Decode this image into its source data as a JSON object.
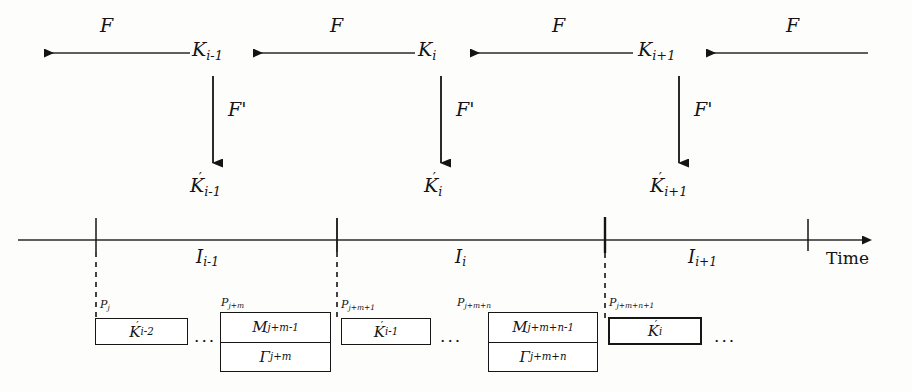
{
  "figure": {
    "type": "timeline-state-diagram",
    "background_color": "#fdfdfc",
    "ink_color": "#141414"
  },
  "chain": {
    "edge_label": "F",
    "edge_labels": [
      "F",
      "F",
      "F",
      "F"
    ],
    "nodes": [
      {
        "name": "K",
        "sub": "i-1",
        "text": "K"
      },
      {
        "name": "K",
        "sub": "i",
        "text": "K"
      },
      {
        "name": "K",
        "sub": "i+1",
        "text": "K"
      }
    ],
    "node_texts": [
      "K",
      "K",
      "K"
    ],
    "node_subs": [
      "i-1",
      "i",
      "i+1"
    ]
  },
  "derivation": {
    "arrow_label": "F'",
    "arrow_labels": [
      "F'",
      "F'",
      "F'"
    ],
    "derived_texts": [
      "K",
      "K",
      "K"
    ],
    "derived_subs": [
      "i-1",
      "i",
      "i+1"
    ]
  },
  "timeline": {
    "axis_label": "Time",
    "intervals": [
      {
        "text": "I",
        "sub": "i-1"
      },
      {
        "text": "I",
        "sub": "i"
      },
      {
        "text": "I",
        "sub": "i+1"
      }
    ],
    "interval_texts": [
      "I",
      "I",
      "I"
    ],
    "interval_subs": [
      "i-1",
      "i",
      "i+1"
    ]
  },
  "pointers": [
    {
      "text": "P",
      "sub": "j"
    },
    {
      "text": "P",
      "sub": "j+m"
    },
    {
      "text": "P",
      "sub": "j+m+1"
    },
    {
      "text": "P",
      "sub": "j+m+n"
    },
    {
      "text": "P",
      "sub": "j+m+n+1"
    }
  ],
  "pointer_texts": [
    "P",
    "P",
    "P",
    "P",
    "P"
  ],
  "pointer_subs": [
    "j",
    "j+m",
    "j+m+1",
    "j+m+n",
    "j+m+n+1"
  ],
  "blocks": [
    {
      "kind": "single",
      "top_text": "K",
      "top_sub": "i-2",
      "primed": true
    },
    {
      "kind": "double",
      "top_text": "M",
      "top_sub": "j+m-1",
      "bottom_text": "Γ",
      "bottom_sub": "j+m"
    },
    {
      "kind": "single",
      "top_text": "K",
      "top_sub": "i-1",
      "primed": true
    },
    {
      "kind": "double",
      "top_text": "M",
      "top_sub": "j+m+n-1",
      "bottom_text": "Γ",
      "bottom_sub": "j+m+n"
    },
    {
      "kind": "single",
      "top_text": "K",
      "top_sub": "i",
      "primed": true
    }
  ],
  "ellipses": [
    "...",
    "...",
    "...",
    "..."
  ]
}
